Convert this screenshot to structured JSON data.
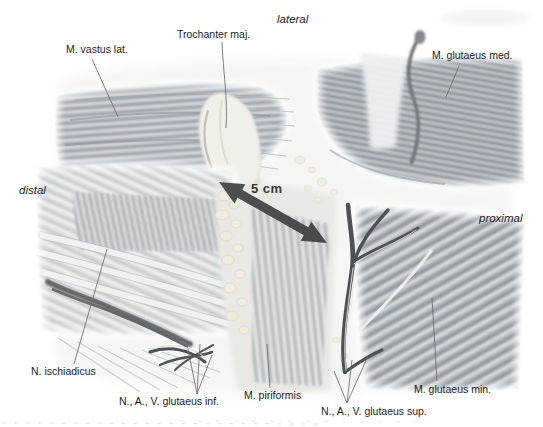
{
  "figure": {
    "kind": "anatomical illustration, posterolateral hip (gluteal region) dissection",
    "orientation": {
      "lateral": "lateral",
      "distal": "distal",
      "proximal": "proximal"
    },
    "measurement": {
      "text": "5 cm"
    },
    "anatomy_labels": {
      "vastus_lat": "M. vastus lat.",
      "trochanter": "Trochanter maj.",
      "glutaeus_med": "M. glutaeus med.",
      "ischiadicus": "N. ischiadicus",
      "glutaeus_inf": "N., A., V. glutaeus inf.",
      "piriformis": "M. piriformis",
      "glutaeus_sup": "N., A., V. glutaeus sup.",
      "glutaeus_min": "M. glutaeus min."
    },
    "colors": {
      "background": "#ffffff",
      "label_text": "#1c1c1c",
      "leader_line": "#6b6b6b",
      "arrow": "#3e4042",
      "bone": "#f1efe9",
      "fat": "#efebdd",
      "muscle_mid_gray": "#aab0b5",
      "vessel_dark": "#4d5154"
    }
  }
}
